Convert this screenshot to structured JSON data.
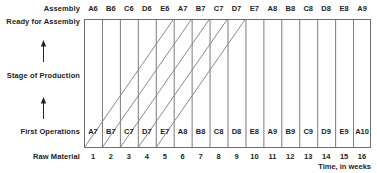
{
  "chart_data": {
    "type": "diagram",
    "title": "",
    "xlabel": "Time, in weeks",
    "ylabel": "Stage of Production",
    "grid": true,
    "legend": "none",
    "xlim": [
      0,
      16
    ],
    "stage_axis": {
      "top": "Assembly",
      "upper_mid": "Ready for Assembly",
      "middle": "Stage of Production",
      "lower_mid": "First Operations",
      "bottom": "Raw Material",
      "arrow_icon": "up-arrow-icon"
    },
    "x_ticks": [
      "1",
      "2",
      "3",
      "4",
      "5",
      "6",
      "7",
      "8",
      "9",
      "10",
      "11",
      "12",
      "13",
      "14",
      "15",
      "16"
    ],
    "assembly_outputs": [
      "A6",
      "B6",
      "C6",
      "D6",
      "E6",
      "A7",
      "B7",
      "C7",
      "D7",
      "E7",
      "A8",
      "B8",
      "C8",
      "D8",
      "E8",
      "A9"
    ],
    "first_operations_inputs": [
      "A7",
      "B7",
      "C7",
      "D7",
      "E7",
      "A8",
      "B8",
      "C8",
      "D8",
      "E8",
      "A9",
      "B9",
      "C9",
      "D9",
      "E9",
      "A10"
    ],
    "flow_lines": {
      "description": "Each diagonal traces one job from First Operations in its start week up to Assembly five weeks later.",
      "lead_time_weeks": 5,
      "count": 5,
      "start_weeks": [
        1,
        2,
        3,
        4,
        5
      ],
      "end_weeks": [
        6,
        7,
        8,
        9,
        10
      ]
    }
  },
  "colors": {
    "frame": "#6e6e6e",
    "gridline": "#7a7a7a",
    "flow_line": "#8a8a8a",
    "text": "#242424",
    "background": "#ffffff"
  }
}
